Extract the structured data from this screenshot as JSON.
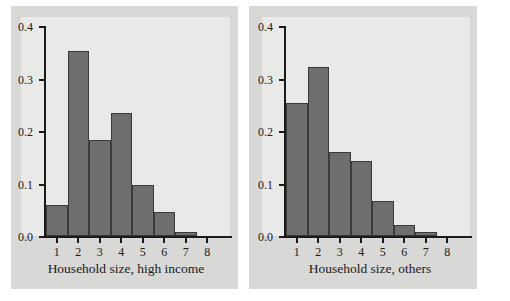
{
  "figure": {
    "background_color": "#ffffff",
    "panel_color": "#d8d8d6",
    "plot_background_color": "#e9e9e7",
    "bar_color": "#6e6e6e",
    "bar_edge_color": "#3a3a3a",
    "axis_color": "#1a1a1a"
  },
  "chart_data": [
    {
      "type": "bar",
      "title": "",
      "xlabel": "Household size, high income",
      "ylabel": "",
      "categories": [
        "1",
        "2",
        "3",
        "4",
        "5",
        "6",
        "7",
        "8"
      ],
      "values": [
        0.059,
        0.352,
        0.183,
        0.234,
        0.097,
        0.046,
        0.008,
        0.0
      ],
      "ylim": [
        0.0,
        0.4
      ],
      "yticks": [
        "0.0",
        "0.1",
        "0.2",
        "0.3",
        "0.4"
      ],
      "ytick_values": [
        0.0,
        0.1,
        0.2,
        0.3,
        0.4
      ],
      "grid": false,
      "legend": "none"
    },
    {
      "type": "bar",
      "title": "",
      "xlabel": "Household size, others",
      "ylabel": "",
      "categories": [
        "1",
        "2",
        "3",
        "4",
        "5",
        "6",
        "7",
        "8"
      ],
      "values": [
        0.253,
        0.322,
        0.16,
        0.143,
        0.067,
        0.021,
        0.008,
        0.0
      ],
      "ylim": [
        0.0,
        0.4
      ],
      "yticks": [
        "0.0",
        "0.1",
        "0.2",
        "0.3",
        "0.4"
      ],
      "ytick_values": [
        0.0,
        0.1,
        0.2,
        0.3,
        0.4
      ],
      "grid": false,
      "legend": "none"
    }
  ]
}
